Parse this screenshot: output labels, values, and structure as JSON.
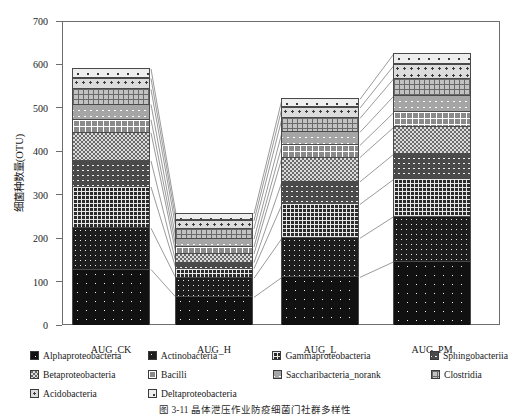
{
  "chart_data": {
    "type": "bar",
    "subtype": "stacked-bar",
    "title": "",
    "xlabel": "",
    "ylabel": "细菌种数量(OTU)",
    "ylim": [
      0,
      700
    ],
    "ytick_values": [
      0,
      100,
      200,
      300,
      400,
      500,
      600,
      700
    ],
    "ytick_labels": [
      "0",
      "100",
      "200",
      "300",
      "400",
      "500",
      "600",
      "700"
    ],
    "grid": false,
    "legend_position": "below",
    "categories": [
      "AUG_CK",
      "AUG_H",
      "AUG_L",
      "AUG_PM"
    ],
    "series": [
      {
        "name": "Alphaproteobacteria",
        "pattern": "dots-sparse-dark",
        "color": "#111111",
        "values": [
          130,
          66,
          112,
          148
        ]
      },
      {
        "name": "Actinobacteria",
        "pattern": "dots-dense-dark",
        "color": "#1d1d1d",
        "values": [
          95,
          44,
          90,
          104
        ]
      },
      {
        "name": "Gammaproteobacteria",
        "pattern": "grid-dark",
        "color": "#2b2b2b",
        "values": [
          95,
          22,
          78,
          86
        ]
      },
      {
        "name": "Sphingobacteriia",
        "pattern": "crosshatch-mid",
        "color": "#4a4a4a",
        "values": [
          60,
          14,
          52,
          58
        ]
      },
      {
        "name": "Betaproteobacteria",
        "pattern": "checker-mid",
        "color": "#6b6b6b",
        "values": [
          65,
          20,
          56,
          62
        ]
      },
      {
        "name": "Bacilli",
        "pattern": "cross-light",
        "color": "#8a8a8a",
        "values": [
          30,
          16,
          28,
          34
        ]
      },
      {
        "name": "Saccharibacteria_norank",
        "pattern": "diamond-light",
        "color": "#a5a5a5",
        "values": [
          35,
          18,
          30,
          38
        ]
      },
      {
        "name": "Clostridia",
        "pattern": "grid-light",
        "color": "#c2c2c2",
        "values": [
          35,
          24,
          32,
          40
        ]
      },
      {
        "name": "Acidobacteria",
        "pattern": "dots-light",
        "color": "#dcdcdc",
        "values": [
          25,
          18,
          24,
          30
        ]
      },
      {
        "name": "Deltaproteobacteria",
        "pattern": "dots-vlight",
        "color": "#eeeeee",
        "values": [
          22,
          16,
          20,
          27
        ]
      }
    ],
    "totals": [
      592,
      258,
      522,
      627
    ]
  },
  "axis": {
    "y_title": "细菌种数量(OTU)"
  },
  "legend": {
    "rows": [
      [
        "Alphaproteobacteria",
        "Actinobacteria",
        "Gammaproteobacteria",
        "Sphingobacteriia"
      ],
      [
        "Betaproteobacteria",
        "Bacilli",
        "Saccharibacteria_norank",
        "Clostridia"
      ],
      [
        "Acidobacteria",
        "Deltaproteobacteria"
      ]
    ]
  },
  "caption": {
    "text": "图 3-11   晶体泄压作业防疫细菌门社群多样性"
  }
}
